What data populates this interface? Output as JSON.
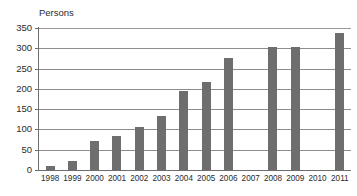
{
  "chart_data": {
    "type": "bar",
    "title": "",
    "ylabel": "Persons",
    "xlabel": "",
    "ylim": [
      0,
      350
    ],
    "ytick_step": 50,
    "yticks": [
      0,
      50,
      100,
      150,
      200,
      250,
      300,
      350
    ],
    "ytick_labels": [
      "0",
      "50",
      "100",
      "150",
      "200",
      "250",
      "300",
      "350"
    ],
    "grid": true,
    "legend": "none",
    "bar_color": "#6e6e6e",
    "axis_color": "#6d6d6d",
    "gridline_color": "#8d8d8d",
    "categories": [
      "1998",
      "1999",
      "2000",
      "2001",
      "2002",
      "2003",
      "2004",
      "2005",
      "2006",
      "2007",
      "2008",
      "2009",
      "2010",
      "2011"
    ],
    "values": [
      11,
      23,
      72,
      84,
      105,
      132,
      194,
      218,
      277,
      0,
      302,
      303,
      0,
      337
    ]
  }
}
